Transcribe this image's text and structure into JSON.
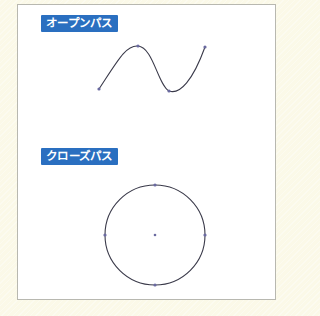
{
  "sections": [
    {
      "label": "オープンパス",
      "shape": "open-path",
      "anchor_points": 4
    },
    {
      "label": "クローズパス",
      "shape": "closed-path",
      "anchor_points": 4,
      "has_center_point": true
    }
  ],
  "colors": {
    "label_bg": "#2a6fc0",
    "label_text": "#ffffff",
    "stroke": "#3a3a4a",
    "anchor": "#6a6aa0",
    "panel_bg": "#ffffff",
    "page_bg": "#fbf9e8"
  }
}
